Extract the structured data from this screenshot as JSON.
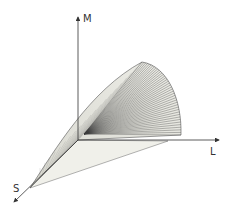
{
  "diagram": {
    "type": "3d-cone-surface",
    "axes": {
      "m": {
        "label": "M"
      },
      "l": {
        "label": "L"
      },
      "s": {
        "label": "S"
      }
    },
    "colors": {
      "axis": "#333333",
      "surface_fill": "#e8e8e2",
      "plane_fill": "#f0f0ea",
      "mesh_line": "#3a3a3a"
    }
  }
}
